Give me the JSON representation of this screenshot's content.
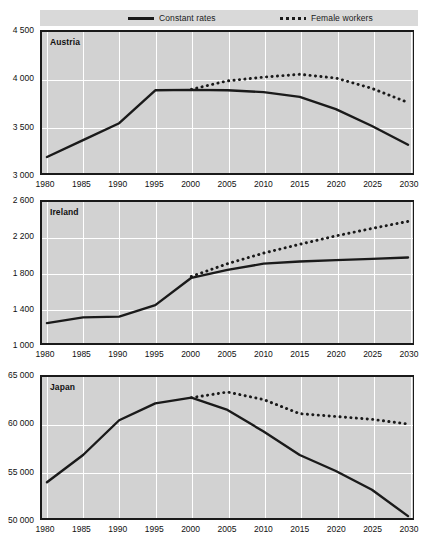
{
  "legend": {
    "items": [
      {
        "label": "Constant rates",
        "style": "solid",
        "color": "#1a1a1a"
      },
      {
        "label": "Female workers",
        "style": "dotted",
        "color": "#1a1a1a"
      }
    ]
  },
  "colors": {
    "plot_background": "#d2d2d2",
    "legend_background": "#d9d9d9",
    "gridline": "#ffffff",
    "line": "#1a1a1a",
    "text": "#111111"
  },
  "xticks": [
    "1980",
    "1985",
    "1990",
    "1995",
    "2000",
    "2005",
    "2010",
    "2015",
    "2020",
    "2025",
    "2030"
  ],
  "chart_data": [
    {
      "type": "line",
      "title": "Austria",
      "xlabel": "",
      "ylabel": "",
      "xlim": [
        1980,
        2030
      ],
      "ylim": [
        3000,
        4500
      ],
      "yticks": [
        "3 000",
        "3 500",
        "4 000",
        "4 500"
      ],
      "ytick_values": [
        3000,
        3500,
        4000,
        4500
      ],
      "grid": true,
      "legend_position": "top",
      "x": [
        1980,
        1985,
        1990,
        1995,
        2000,
        2005,
        2010,
        2015,
        2020,
        2025,
        2030
      ],
      "series": [
        {
          "name": "Constant rates",
          "style": "solid",
          "values": [
            3170,
            3350,
            3530,
            3880,
            3885,
            3880,
            3860,
            3810,
            3680,
            3500,
            3300
          ]
        },
        {
          "name": "Female workers",
          "style": "dotted",
          "values": [
            null,
            null,
            null,
            null,
            3890,
            3980,
            4020,
            4050,
            4010,
            3900,
            3750
          ]
        }
      ]
    },
    {
      "type": "line",
      "title": "Ireland",
      "xlabel": "",
      "ylabel": "",
      "xlim": [
        1980,
        2030
      ],
      "ylim": [
        1000,
        2600
      ],
      "yticks": [
        "1 000",
        "1 400",
        "1 800",
        "2 200",
        "2 600"
      ],
      "ytick_values": [
        1000,
        1400,
        1800,
        2200,
        2600
      ],
      "grid": true,
      "legend_position": "top",
      "x": [
        1980,
        1985,
        1990,
        1995,
        2000,
        2005,
        2010,
        2015,
        2020,
        2025,
        2030
      ],
      "series": [
        {
          "name": "Constant rates",
          "style": "solid",
          "values": [
            1225,
            1290,
            1300,
            1430,
            1740,
            1830,
            1900,
            1925,
            1940,
            1955,
            1970
          ]
        },
        {
          "name": "Female workers",
          "style": "dotted",
          "values": [
            null,
            null,
            null,
            null,
            1755,
            1900,
            2020,
            2120,
            2215,
            2300,
            2380
          ]
        }
      ]
    },
    {
      "type": "line",
      "title": "Japan",
      "xlabel": "",
      "ylabel": "",
      "xlim": [
        1980,
        2030
      ],
      "ylim": [
        50000,
        65000
      ],
      "yticks": [
        "50 000",
        "55 000",
        "60 000",
        "65 000"
      ],
      "ytick_values": [
        50000,
        55000,
        60000,
        65000
      ],
      "grid": true,
      "legend_position": "top",
      "x": [
        1980,
        1985,
        1990,
        1995,
        2000,
        2005,
        2010,
        2015,
        2020,
        2025,
        2030
      ],
      "series": [
        {
          "name": "Constant rates",
          "style": "solid",
          "values": [
            53800,
            56700,
            60400,
            62200,
            62800,
            61500,
            59200,
            56700,
            55000,
            53000,
            50200
          ]
        },
        {
          "name": "Female workers",
          "style": "dotted",
          "values": [
            null,
            null,
            null,
            null,
            62800,
            63400,
            62600,
            61100,
            60800,
            60500,
            60000
          ]
        }
      ]
    }
  ]
}
